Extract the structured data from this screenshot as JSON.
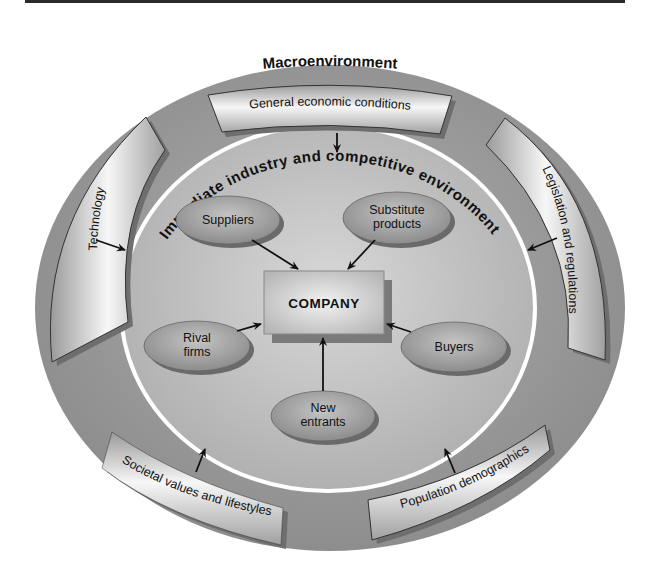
{
  "diagram": {
    "outer_title": "Macroenvironment",
    "inner_title": "Immediate industry and competitive environment",
    "center": {
      "label": "COMPANY"
    },
    "macro_factors": [
      {
        "id": "economic",
        "label": "General economic conditions"
      },
      {
        "id": "technology",
        "label": "Technology"
      },
      {
        "id": "legislation",
        "label": "Legislation and regulations"
      },
      {
        "id": "societal",
        "label": "Societal values and lifestyles"
      },
      {
        "id": "demographics",
        "label": "Population demographics"
      }
    ],
    "competitive_forces": [
      {
        "id": "suppliers",
        "lines": [
          "Suppliers"
        ]
      },
      {
        "id": "substitutes",
        "lines": [
          "Substitute",
          "products"
        ]
      },
      {
        "id": "rivals",
        "lines": [
          "Rival",
          "firms"
        ]
      },
      {
        "id": "buyers",
        "lines": [
          "Buyers"
        ]
      },
      {
        "id": "entrants",
        "lines": [
          "New",
          "entrants"
        ]
      }
    ],
    "colors": {
      "outer_ring": "#8f8f8f",
      "inner_field": "#bdbdbd",
      "ring_line": "#ffffff",
      "oval": "#9a9a9a",
      "box": "#c9c9c9"
    }
  }
}
